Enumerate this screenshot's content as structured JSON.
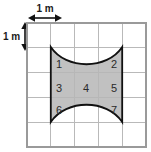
{
  "figure": {
    "background_color": "#ffffff",
    "grid": {
      "columns": 5,
      "rows": 5,
      "cell_size_label": "1 m",
      "line_color": "#b9b9b9",
      "border_color": "#9a9a9a",
      "left": 27,
      "top": 23,
      "width": 119,
      "height": 124
    },
    "dimension_labels": {
      "horizontal": "1 m",
      "vertical": "1 m"
    },
    "shaded_region": {
      "fill_color": "#b6b6b6",
      "outline_color": "#111111",
      "left": 51,
      "right": 122,
      "top": 47,
      "bottom": 122,
      "top_curve": "concave-down-into-region",
      "bottom_curve": "concave-up-into-region",
      "spans_columns": 3,
      "spans_rows": 3
    },
    "cell_numbers": [
      {
        "id": "1",
        "label": "1",
        "x": 59,
        "y": 68
      },
      {
        "id": "2",
        "label": "2",
        "x": 114,
        "y": 68
      },
      {
        "id": "3",
        "label": "3",
        "x": 59,
        "y": 92
      },
      {
        "id": "4",
        "label": "4",
        "x": 86,
        "y": 92
      },
      {
        "id": "5",
        "label": "5",
        "x": 114,
        "y": 92
      },
      {
        "id": "6",
        "label": "6",
        "x": 59,
        "y": 114
      },
      {
        "id": "7",
        "label": "7",
        "x": 114,
        "y": 114
      }
    ]
  }
}
